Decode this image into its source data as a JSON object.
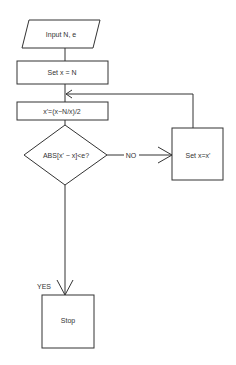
{
  "diagram": {
    "type": "flowchart",
    "nodes": {
      "input": {
        "shape": "parallelogram",
        "label": "Input N, e"
      },
      "init": {
        "shape": "rectangle",
        "label": "Set x = N"
      },
      "compute": {
        "shape": "rectangle",
        "label": "x'=(x−N/x)/2"
      },
      "decision": {
        "shape": "diamond",
        "label": "ABS[x' − x]<e?"
      },
      "update": {
        "shape": "rectangle",
        "label": "Set x=x'"
      },
      "stop": {
        "shape": "rectangle",
        "label": "Stop"
      }
    },
    "edges": {
      "no_label": "NO",
      "yes_label": "YES"
    },
    "colors": {
      "line": "#333333",
      "background": "#ffffff"
    }
  }
}
